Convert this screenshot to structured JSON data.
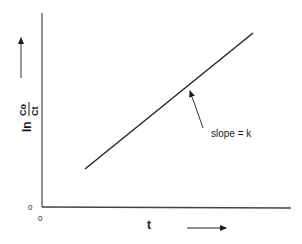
{
  "diagram": {
    "type": "first-order kinetics plot",
    "y_axis": {
      "label_prefix": "ln",
      "label_numerator": "Co",
      "label_denominator": "Ct",
      "origin_label": "0",
      "direction_arrow": "up-arrow"
    },
    "x_axis": {
      "label": "t",
      "origin_label": "0",
      "direction_arrow": "right-arrow"
    },
    "line": {
      "description": "straight line with positive slope",
      "annotation": "slope = k"
    },
    "colors": {
      "ink": "#1a1a1a",
      "axis": "#444444",
      "background": "#ffffff"
    }
  }
}
